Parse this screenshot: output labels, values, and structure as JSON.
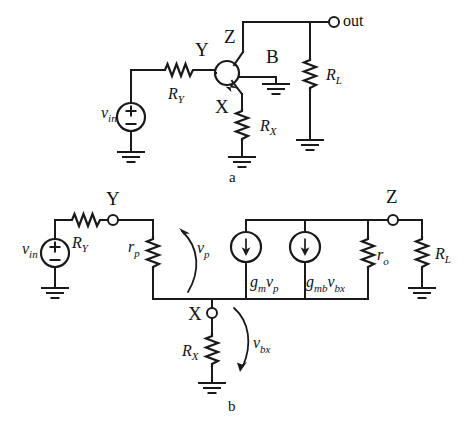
{
  "figure": {
    "background_color": "#ffffff",
    "line_color": "#1a1a1a"
  },
  "panel_a": {
    "caption": "a",
    "source": {
      "name": "vin",
      "label_main": "v",
      "label_sub": "in",
      "plus": "+",
      "minus": "−"
    },
    "resistors": [
      {
        "id": "RY",
        "label_main": "R",
        "label_sub": "Y",
        "orientation": "horizontal"
      },
      {
        "id": "RX",
        "label_main": "R",
        "label_sub": "X",
        "orientation": "vertical"
      },
      {
        "id": "RL",
        "label_main": "R",
        "label_sub": "L",
        "orientation": "vertical"
      }
    ],
    "nodes": [
      {
        "id": "Y",
        "label": "Y"
      },
      {
        "id": "Z",
        "label": "Z"
      },
      {
        "id": "X",
        "label": "X"
      },
      {
        "id": "B",
        "label": "B"
      },
      {
        "id": "out",
        "label": "out"
      }
    ],
    "device": {
      "type": "transistor",
      "name": "transistor-symbol"
    }
  },
  "panel_b": {
    "caption": "b",
    "source": {
      "name": "vin",
      "label_main": "v",
      "label_sub": "in",
      "plus": "+",
      "minus": "−"
    },
    "resistors": [
      {
        "id": "RY",
        "label_main": "R",
        "label_sub": "Y",
        "orientation": "horizontal"
      },
      {
        "id": "rp",
        "label_main": "r",
        "label_sub": "p",
        "orientation": "vertical"
      },
      {
        "id": "ro",
        "label_main": "r",
        "label_sub": "o",
        "orientation": "vertical"
      },
      {
        "id": "RX",
        "label_main": "R",
        "label_sub": "X",
        "orientation": "vertical"
      },
      {
        "id": "RL",
        "label_main": "R",
        "label_sub": "L",
        "orientation": "vertical"
      }
    ],
    "nodes": [
      {
        "id": "Y",
        "label": "Y"
      },
      {
        "id": "X",
        "label": "X"
      },
      {
        "id": "Z",
        "label": "Z"
      }
    ],
    "current_sources": [
      {
        "id": "gm_vp",
        "label_g": "g",
        "label_g_sub": "m",
        "label_v": "v",
        "label_v_sub": "p",
        "direction": "down"
      },
      {
        "id": "gmb_vbx",
        "label_g": "g",
        "label_g_sub": "mb",
        "label_v": "v",
        "label_v_sub": "bx",
        "direction": "down"
      }
    ],
    "voltage_arrows": [
      {
        "id": "vp",
        "label_main": "v",
        "label_sub": "p",
        "direction": "up"
      },
      {
        "id": "vbx",
        "label_main": "v",
        "label_sub": "bx",
        "direction": "down"
      }
    ]
  }
}
